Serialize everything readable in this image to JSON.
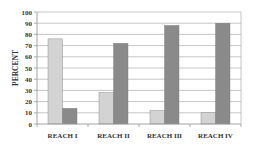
{
  "chart_data": {
    "type": "bar",
    "title": "",
    "xlabel": "",
    "ylabel": "PERCENT",
    "categories": [
      "REACH   I",
      "REACH  II",
      "REACH  III",
      "REACH  IV"
    ],
    "series": [
      {
        "name": "Series 1",
        "color": "#d3d3d3",
        "values": [
          76,
          28,
          12,
          10
        ]
      },
      {
        "name": "Series 2",
        "color": "#8a8a8a",
        "values": [
          14,
          72,
          88,
          90
        ]
      }
    ],
    "ylim": [
      0,
      100
    ],
    "yticks": [
      0,
      10,
      20,
      30,
      40,
      50,
      60,
      70,
      80,
      90,
      100
    ],
    "grid": true,
    "legend": "none"
  },
  "colors": {
    "grid": "#b8b8b8",
    "axis": "#9a9a9a",
    "bar_border": "#7a7a7a"
  }
}
